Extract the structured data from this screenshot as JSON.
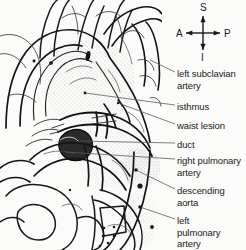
{
  "figure": {
    "background_color": "#fbfbfa",
    "ink_color": "#1a1a1a",
    "stipple_color": "#8a8a8a"
  },
  "compass": {
    "name": "orientation-compass",
    "center": {
      "x": 203,
      "y": 33
    },
    "directions": [
      {
        "key": "superior",
        "label": "S",
        "x": 200,
        "y": 2
      },
      {
        "key": "inferior",
        "label": "I",
        "x": 201,
        "y": 52
      },
      {
        "key": "anterior",
        "label": "A",
        "x": 176,
        "y": 28
      },
      {
        "key": "posterior",
        "label": "P",
        "x": 224,
        "y": 28
      }
    ]
  },
  "labels": [
    {
      "id": "left-subclavian-artery",
      "lines": [
        "left subclavian",
        "artery"
      ],
      "x": 177,
      "y": 68,
      "leader": {
        "x1": 175,
        "y1": 72,
        "x2": 150,
        "y2": 60
      }
    },
    {
      "id": "isthmus",
      "lines": [
        "isthmus"
      ],
      "x": 177,
      "y": 101,
      "leader": {
        "x1": 175,
        "y1": 105,
        "x2": 85,
        "y2": 93
      }
    },
    {
      "id": "waist-lesion",
      "lines": [
        "waist lesion"
      ],
      "x": 177,
      "y": 120,
      "leader": {
        "x1": 175,
        "y1": 124,
        "x2": 118,
        "y2": 103
      }
    },
    {
      "id": "duct",
      "lines": [
        "duct"
      ],
      "x": 177,
      "y": 139,
      "leader": {
        "x1": 175,
        "y1": 143,
        "x2": 78,
        "y2": 141
      }
    },
    {
      "id": "right-pulmonary-artery",
      "lines": [
        "right pulmonary",
        "artery"
      ],
      "x": 177,
      "y": 155,
      "leader": {
        "x1": 175,
        "y1": 159,
        "x2": 65,
        "y2": 152
      }
    },
    {
      "id": "descending-aorta",
      "lines": [
        "descending",
        "aorta"
      ],
      "x": 177,
      "y": 185,
      "leader": {
        "x1": 175,
        "y1": 189,
        "x2": 136,
        "y2": 170
      }
    },
    {
      "id": "left-pulmonary-artery",
      "lines": [
        "left",
        "pulmonary",
        "artery"
      ],
      "x": 177,
      "y": 215,
      "leader": {
        "x1": 175,
        "y1": 219,
        "x2": 140,
        "y2": 207
      }
    }
  ],
  "marker_dots": [
    {
      "x": 136,
      "y": 170,
      "r": 1.8
    },
    {
      "x": 140,
      "y": 186,
      "r": 2.6
    },
    {
      "x": 140,
      "y": 207,
      "r": 1.8
    },
    {
      "x": 152,
      "y": 227,
      "r": 1.9
    },
    {
      "x": 85,
      "y": 93,
      "r": 1.4
    },
    {
      "x": 51,
      "y": 63,
      "r": 1.6
    },
    {
      "x": 34,
      "y": 61,
      "r": 1.3
    },
    {
      "x": 118,
      "y": 103,
      "r": 1.2
    },
    {
      "x": 70,
      "y": 190,
      "r": 1.2
    }
  ],
  "calcification_cluster": [
    {
      "x": 104,
      "y": 228,
      "r": 1.3
    },
    {
      "x": 114,
      "y": 227,
      "r": 1.3
    },
    {
      "x": 103,
      "y": 236,
      "r": 1.3
    },
    {
      "x": 114,
      "y": 236,
      "r": 1.3
    },
    {
      "x": 108,
      "y": 243,
      "r": 1.3
    },
    {
      "x": 100,
      "y": 246,
      "r": 1.3
    }
  ]
}
